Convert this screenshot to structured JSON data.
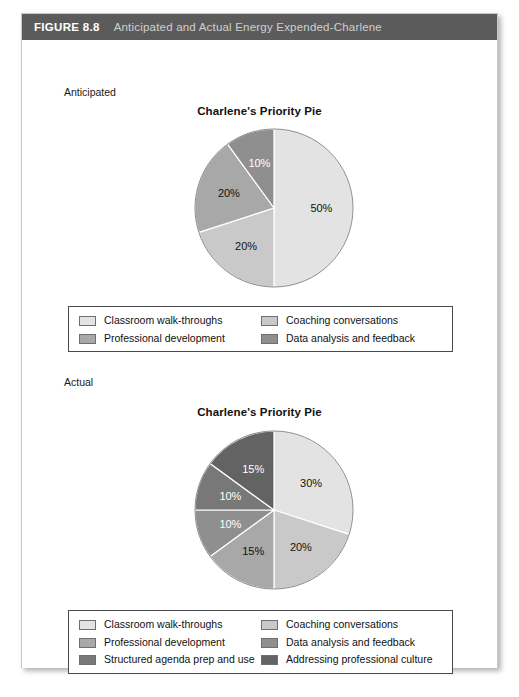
{
  "figure": {
    "number": "FIGURE 8.8",
    "title": "Anticipated and Actual Energy Expended-Charlene"
  },
  "sections": {
    "anticipated_label": "Anticipated",
    "actual_label": "Actual"
  },
  "colors": {
    "header_bg": "#5b5b5b",
    "swatch_1": "#e3e3e3",
    "swatch_2": "#c9c9c9",
    "swatch_3": "#a8a8a8",
    "swatch_4": "#8f8f8f",
    "swatch_5": "#787878",
    "swatch_6": "#636363",
    "border": "#4a4a4a"
  },
  "legend_top": {
    "items": [
      {
        "label": "Classroom walk-throughs",
        "color": "#e3e3e3"
      },
      {
        "label": "Coaching conversations",
        "color": "#c9c9c9"
      },
      {
        "label": "Professional development",
        "color": "#a8a8a8"
      },
      {
        "label": "Data analysis and feedback",
        "color": "#8f8f8f"
      }
    ]
  },
  "legend_bottom": {
    "items": [
      {
        "label": "Classroom walk-throughs",
        "color": "#e3e3e3"
      },
      {
        "label": "Coaching conversations",
        "color": "#c9c9c9"
      },
      {
        "label": "Professional development",
        "color": "#a8a8a8"
      },
      {
        "label": "Data analysis and feedback",
        "color": "#8f8f8f"
      },
      {
        "label": "Structured agenda prep and use",
        "color": "#787878"
      },
      {
        "label": "Addressing professional culture",
        "color": "#636363"
      }
    ]
  },
  "chart_data": [
    {
      "type": "pie",
      "title": "Charlene's Priority Pie",
      "section": "Anticipated",
      "categories": [
        "Classroom walk-throughs",
        "Coaching conversations",
        "Professional development",
        "Data analysis and feedback"
      ],
      "values": [
        50,
        20,
        20,
        10
      ],
      "labels": [
        "50%",
        "20%",
        "20%",
        "10%"
      ],
      "colors": [
        "#e3e3e3",
        "#c9c9c9",
        "#a8a8a8",
        "#8f8f8f"
      ],
      "label_colors": [
        "#111111",
        "#111111",
        "#111111",
        "#ffffff"
      ],
      "start_angle_deg": 0,
      "direction": "clockwise",
      "legend_position": "below"
    },
    {
      "type": "pie",
      "title": "Charlene's Priority Pie",
      "section": "Actual",
      "categories": [
        "Classroom walk-throughs",
        "Coaching conversations",
        "Professional development",
        "Data analysis and feedback",
        "Structured agenda prep and use",
        "Addressing professional culture"
      ],
      "values": [
        30,
        20,
        15,
        10,
        10,
        15
      ],
      "labels": [
        "30%",
        "20%",
        "15%",
        "10%",
        "10%",
        "15%"
      ],
      "colors": [
        "#e3e3e3",
        "#c9c9c9",
        "#a8a8a8",
        "#8f8f8f",
        "#787878",
        "#636363"
      ],
      "label_colors": [
        "#111111",
        "#111111",
        "#111111",
        "#ffffff",
        "#ffffff",
        "#ffffff"
      ],
      "start_angle_deg": 0,
      "direction": "clockwise",
      "legend_position": "below"
    }
  ]
}
